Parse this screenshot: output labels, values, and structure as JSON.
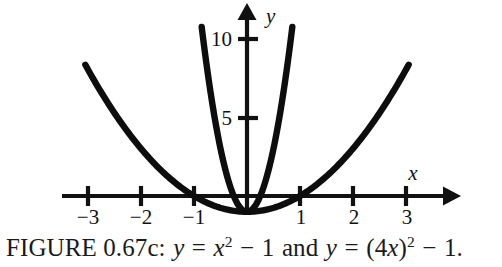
{
  "figure": {
    "caption": {
      "label": "FIGURE 0.67c:",
      "full_text": "FIGURE 0.67c: y = x2 − 1 and y = (4x)2 − 1.",
      "eq1": {
        "lhs": "y",
        "equals": "=",
        "base": "x",
        "exponent": "2",
        "minus": "−",
        "constant": "1"
      },
      "conjunction": "and",
      "eq2": {
        "lhs": "y",
        "equals": "=",
        "open_paren": "(",
        "coefficient": "4",
        "variable": "x",
        "close_paren": ")",
        "exponent": "2",
        "minus": "−",
        "constant": "1"
      },
      "period": "."
    },
    "colors": {
      "background": "#ffffff",
      "curve": "#0d0d0d",
      "axis": "#111111",
      "text": "#1a1a1a"
    }
  },
  "chart_data": {
    "type": "line",
    "xlabel": "x",
    "ylabel": "y",
    "xlim": [
      -3.4,
      3.95
    ],
    "ylim": [
      -2.6,
      12.7
    ],
    "grid": false,
    "legend": "none",
    "x_ticks": [
      -3,
      -2,
      -1,
      1,
      2,
      3
    ],
    "x_tick_labels": [
      "−3",
      "−2",
      "−1",
      "1",
      "2",
      "3"
    ],
    "y_ticks": [
      5,
      10
    ],
    "y_tick_labels": [
      "5",
      "10"
    ],
    "axes": {
      "x_axis_arrow": "right",
      "y_axis_arrow": "up",
      "origin": [
        0,
        0
      ]
    },
    "series": [
      {
        "name": "y = x^2 - 1",
        "equation": "y = x² − 1",
        "type": "parabola",
        "a": 1,
        "vertex": [
          0,
          -1
        ],
        "x_intercepts": [
          -1,
          1
        ],
        "y_intercept": -1,
        "x_domain": [
          -3.05,
          3.05
        ],
        "points": [
          {
            "x": -3.05,
            "y": 8.3
          },
          {
            "x": -2.5,
            "y": 5.25
          },
          {
            "x": -2.0,
            "y": 3.0
          },
          {
            "x": -1.5,
            "y": 1.25
          },
          {
            "x": -1.0,
            "y": 0.0
          },
          {
            "x": -0.5,
            "y": -0.75
          },
          {
            "x": 0.0,
            "y": -1.0
          },
          {
            "x": 0.5,
            "y": -0.75
          },
          {
            "x": 1.0,
            "y": 0.0
          },
          {
            "x": 1.5,
            "y": 1.25
          },
          {
            "x": 2.0,
            "y": 3.0
          },
          {
            "x": 2.5,
            "y": 5.25
          },
          {
            "x": 3.05,
            "y": 8.3
          }
        ]
      },
      {
        "name": "y = (4x)^2 - 1",
        "equation": "y = (4x)² − 1",
        "type": "parabola",
        "a": 16,
        "vertex": [
          0,
          -1
        ],
        "x_intercepts": [
          -0.25,
          0.25
        ],
        "y_intercept": -1,
        "x_domain": [
          -0.855,
          0.855
        ],
        "points": [
          {
            "x": -0.855,
            "y": 10.7
          },
          {
            "x": -0.7,
            "y": 6.84
          },
          {
            "x": -0.55,
            "y": 2.87
          },
          {
            "x": -0.4,
            "y": 1.56
          },
          {
            "x": -0.25,
            "y": 0.0
          },
          {
            "x": -0.125,
            "y": -0.75
          },
          {
            "x": 0.0,
            "y": -1.0
          },
          {
            "x": 0.125,
            "y": -0.75
          },
          {
            "x": 0.25,
            "y": 0.0
          },
          {
            "x": 0.4,
            "y": 1.56
          },
          {
            "x": 0.55,
            "y": 2.87
          },
          {
            "x": 0.7,
            "y": 6.84
          },
          {
            "x": 0.855,
            "y": 10.7
          }
        ]
      }
    ]
  }
}
